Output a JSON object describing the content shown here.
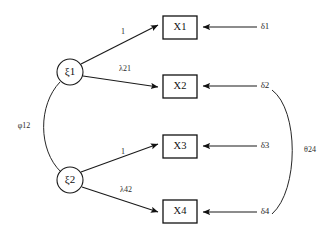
{
  "diagram": {
    "latent_factors": [
      {
        "id": "xi1",
        "label": "ξ1",
        "cx": 70,
        "cy": 72,
        "r": 13
      },
      {
        "id": "xi2",
        "label": "ξ2",
        "cx": 70,
        "cy": 180,
        "r": 13
      }
    ],
    "indicators": [
      {
        "id": "x1",
        "label": "X1",
        "x": 163,
        "y": 16,
        "w": 34,
        "h": 23
      },
      {
        "id": "x2",
        "label": "X2",
        "x": 163,
        "y": 75,
        "w": 34,
        "h": 23
      },
      {
        "id": "x3",
        "label": "X3",
        "x": 163,
        "y": 135,
        "w": 34,
        "h": 23
      },
      {
        "id": "x4",
        "label": "X4",
        "x": 163,
        "y": 200,
        "w": 34,
        "h": 23
      }
    ],
    "errors": [
      {
        "id": "d1",
        "label": "δ1",
        "x": 265,
        "y": 27
      },
      {
        "id": "d2",
        "label": "δ2",
        "x": 265,
        "y": 86
      },
      {
        "id": "d3",
        "label": "δ3",
        "x": 265,
        "y": 146
      },
      {
        "id": "d4",
        "label": "δ4",
        "x": 265,
        "y": 212
      }
    ],
    "loadings": [
      {
        "id": "l11",
        "label": "1",
        "from": "xi1",
        "to": "x1",
        "x": 123,
        "y": 32
      },
      {
        "id": "l21",
        "label": "λ21",
        "from": "xi1",
        "to": "x2",
        "x": 125,
        "y": 69
      },
      {
        "id": "l32",
        "label": "1",
        "from": "xi2",
        "to": "x3",
        "x": 123,
        "y": 152
      },
      {
        "id": "l42",
        "label": "λ42",
        "from": "xi2",
        "to": "x4",
        "x": 126,
        "y": 190
      }
    ],
    "covariances": [
      {
        "id": "phi12",
        "label": "φ12",
        "between": [
          "xi1",
          "xi2"
        ],
        "x": 24,
        "y": 126
      },
      {
        "id": "theta24",
        "label": "θ24",
        "between": [
          "d2",
          "d4"
        ],
        "x": 307,
        "y": 150
      }
    ]
  }
}
